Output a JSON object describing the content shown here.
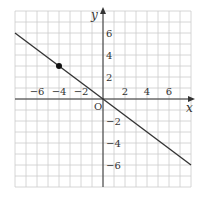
{
  "chart_data": {
    "type": "line",
    "title": "",
    "xlabel": "x",
    "ylabel": "y",
    "xlim": [
      -8,
      8
    ],
    "ylim": [
      -8,
      8
    ],
    "grid": true,
    "origin_label": "O",
    "x_ticks": [
      {
        "value": -6,
        "label": "−6"
      },
      {
        "value": -4,
        "label": "−4"
      },
      {
        "value": -2,
        "label": "−2"
      },
      {
        "value": 2,
        "label": "2"
      },
      {
        "value": 4,
        "label": "4"
      },
      {
        "value": 6,
        "label": "6"
      }
    ],
    "y_ticks": [
      {
        "value": 6,
        "label": "6"
      },
      {
        "value": 4,
        "label": "4"
      },
      {
        "value": 2,
        "label": "2"
      },
      {
        "value": -2,
        "label": "−2"
      },
      {
        "value": -4,
        "label": "−4"
      },
      {
        "value": -6,
        "label": "−6"
      }
    ],
    "series": [
      {
        "name": "y = -3/4 x",
        "x": [
          -8,
          8
        ],
        "y": [
          6,
          -6
        ]
      }
    ],
    "points": [
      {
        "x": -4,
        "y": 3
      }
    ],
    "colors": {
      "grid": "#cccccc",
      "axis": "#333333",
      "line": "#333333",
      "point": "#111111"
    }
  }
}
